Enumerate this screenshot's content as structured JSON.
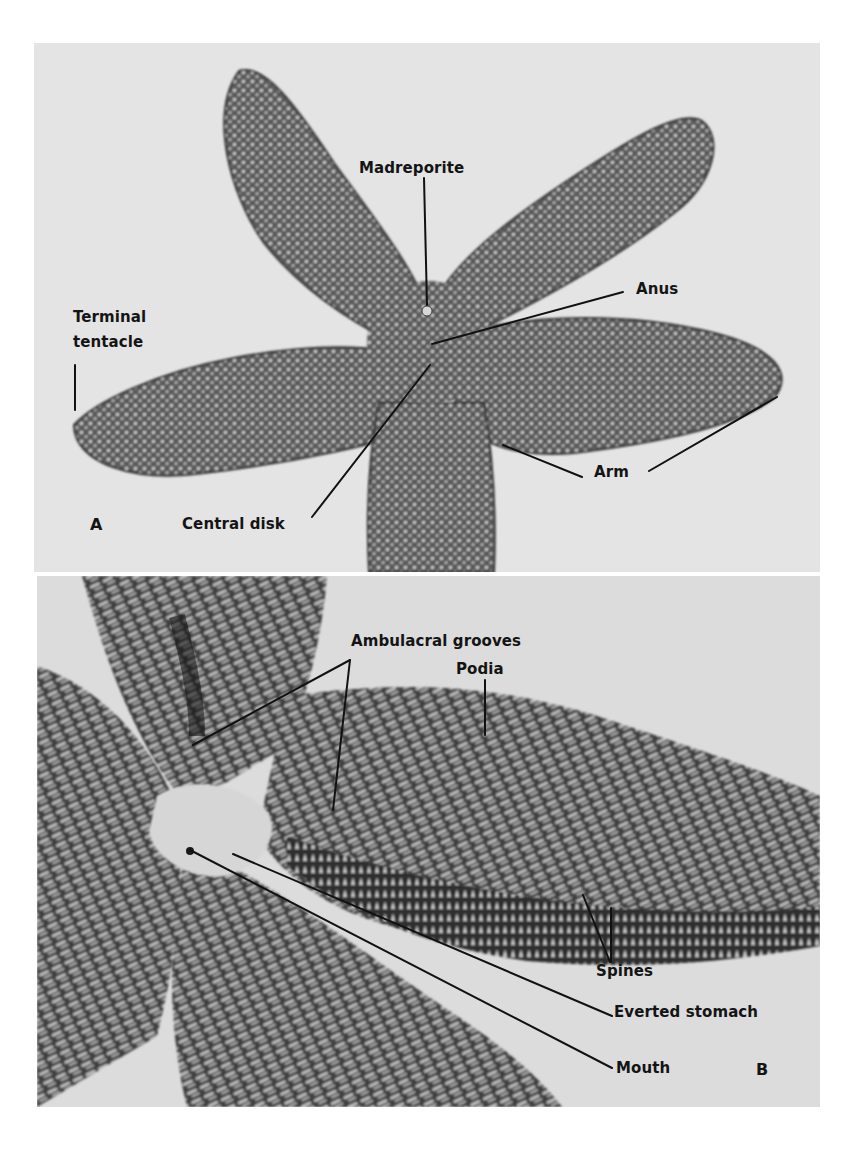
{
  "figure": {
    "panels": [
      {
        "id": "A",
        "letter": "A",
        "view": "aboral surface",
        "labels": {
          "madreporite": "Madreporite",
          "anus": "Anus",
          "terminal_tentacle": "Terminal\ntentacle",
          "arm": "Arm",
          "central_disk": "Central disk"
        }
      },
      {
        "id": "B",
        "letter": "B",
        "view": "oral surface",
        "labels": {
          "ambulacral_grooves": "Ambulacral grooves",
          "podia": "Podia",
          "spines": "Spines",
          "everted_stomach": "Everted stomach",
          "mouth": "Mouth"
        }
      }
    ]
  },
  "colors": {
    "background": "#ffffff",
    "panel_bg_a": "#e4e4e4",
    "panel_bg_b": "#dcdcdc",
    "label_text": "#141414",
    "leader_line": "#111111"
  }
}
